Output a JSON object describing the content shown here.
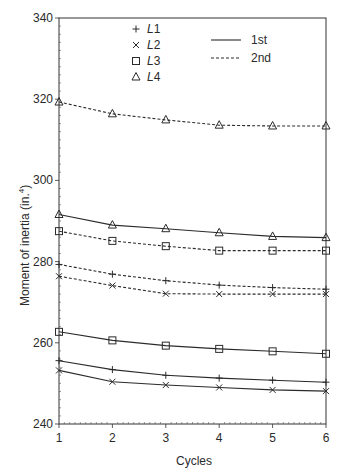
{
  "chart_data": {
    "type": "line",
    "title": "",
    "xlabel": "Cycles",
    "ylabel": "Moment of inertia (in.⁴)",
    "ylabel_base": "Moment of inertia (in.",
    "ylabel_sup": "4",
    "ylabel_end": ")",
    "x": [
      1,
      2,
      3,
      4,
      5,
      6
    ],
    "x_ticks": [
      "1",
      "2",
      "3",
      "4",
      "5",
      "6"
    ],
    "xlim": [
      1,
      6
    ],
    "ylim": [
      240,
      340
    ],
    "y_ticks": [
      240,
      260,
      280,
      300,
      320,
      340
    ],
    "y_tick_labels": [
      "240",
      "260",
      "280",
      "300",
      "320",
      "340"
    ],
    "grid": false,
    "legend": {
      "markers": [
        {
          "symbol": "plus",
          "glyph": "+",
          "label": "L1"
        },
        {
          "symbol": "cross",
          "glyph": "×",
          "label": "L2"
        },
        {
          "symbol": "square",
          "glyph": "□",
          "label": "L3"
        },
        {
          "symbol": "triangle",
          "glyph": "△",
          "label": "L4"
        }
      ],
      "lines": [
        {
          "style": "solid",
          "label": "1st"
        },
        {
          "style": "dashed",
          "label": "2nd"
        }
      ],
      "position": "upper-center"
    },
    "series": [
      {
        "name": "L1 1st",
        "location": "L1",
        "cycle_set": "1st",
        "marker": "plus",
        "style": "solid",
        "values": [
          255.6,
          253.4,
          252.0,
          251.3,
          250.8,
          250.3
        ]
      },
      {
        "name": "L2 1st",
        "location": "L2",
        "cycle_set": "1st",
        "marker": "cross",
        "style": "solid",
        "values": [
          253.2,
          250.4,
          249.6,
          249.0,
          248.4,
          248.1
        ]
      },
      {
        "name": "L3 1st",
        "location": "L3",
        "cycle_set": "1st",
        "marker": "square",
        "style": "solid",
        "values": [
          262.7,
          260.6,
          259.3,
          258.5,
          257.9,
          257.3
        ]
      },
      {
        "name": "L4 1st",
        "location": "L4",
        "cycle_set": "1st",
        "marker": "triangle",
        "style": "solid",
        "values": [
          291.6,
          289.0,
          288.1,
          287.1,
          286.2,
          285.9
        ]
      },
      {
        "name": "L1 2nd",
        "location": "L1",
        "cycle_set": "2nd",
        "marker": "plus",
        "style": "dashed",
        "values": [
          279.3,
          276.9,
          275.3,
          274.2,
          273.6,
          273.2
        ]
      },
      {
        "name": "L2 2nd",
        "location": "L2",
        "cycle_set": "2nd",
        "marker": "cross",
        "style": "dashed",
        "values": [
          276.4,
          274.1,
          272.1,
          272.0,
          272.0,
          272.0
        ]
      },
      {
        "name": "L3 2nd",
        "location": "L3",
        "cycle_set": "2nd",
        "marker": "square",
        "style": "dashed",
        "values": [
          287.5,
          285.1,
          283.8,
          282.7,
          282.7,
          282.7
        ]
      },
      {
        "name": "L4 2nd",
        "location": "L4",
        "cycle_set": "2nd",
        "marker": "triangle",
        "style": "dashed",
        "values": [
          319.3,
          316.4,
          314.9,
          313.6,
          313.4,
          313.4
        ]
      }
    ]
  },
  "colors": {
    "ink": "#2b2b2b",
    "background": "#ffffff"
  }
}
